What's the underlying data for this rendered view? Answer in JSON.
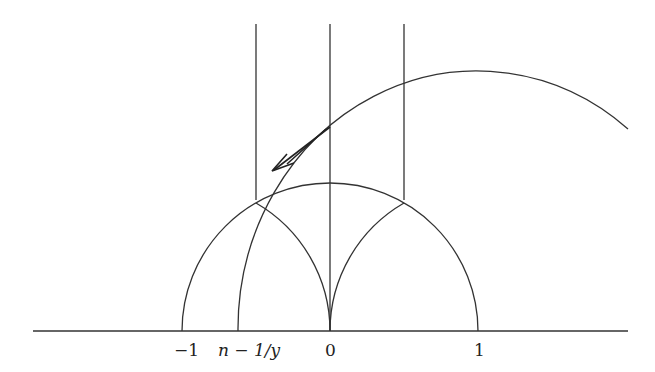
{
  "diagram": {
    "axis_labels": {
      "minus_one": "−1",
      "n_minus_inv_y": "n − 1/y",
      "zero": "0",
      "one": "1"
    },
    "colors": {
      "stroke": "#333333",
      "background": "#ffffff"
    }
  }
}
